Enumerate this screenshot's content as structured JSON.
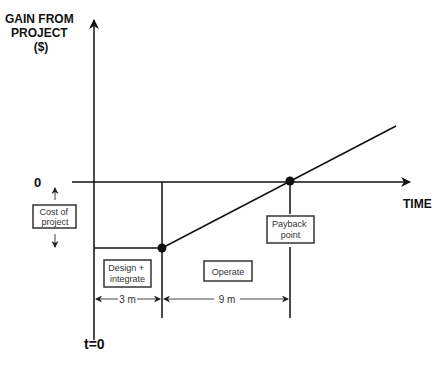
{
  "diagram": {
    "y_axis_label": [
      "GAIN FROM",
      "PROJECT",
      "($)"
    ],
    "x_axis_label": "TIME",
    "zero_label": "0",
    "time_origin_label": "t=0",
    "cost_box": [
      "Cost of",
      "project"
    ],
    "design_box": [
      "Design +",
      "integrate"
    ],
    "operate_box": "Operate",
    "payback_box": [
      "Payback",
      "point"
    ],
    "design_duration": "3 m",
    "operate_duration": "9 m"
  }
}
